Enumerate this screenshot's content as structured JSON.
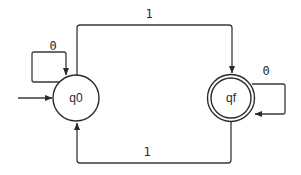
{
  "diagram": {
    "type": "finite-state-automaton",
    "states": [
      {
        "id": "q0",
        "label": "q0",
        "initial": true,
        "accepting": false
      },
      {
        "id": "qf",
        "label": "qf",
        "initial": false,
        "accepting": true
      }
    ],
    "transitions": [
      {
        "from": "q0",
        "to": "q0",
        "label": "0"
      },
      {
        "from": "q0",
        "to": "qf",
        "label": "1"
      },
      {
        "from": "qf",
        "to": "qf",
        "label": "0"
      },
      {
        "from": "qf",
        "to": "q0",
        "label": "1"
      }
    ]
  },
  "labels": {
    "q0": "q0",
    "qf": "qf",
    "q0_self_loop": "0",
    "q0_to_qf": "1",
    "qf_self_loop": "0",
    "qf_to_q0": "1"
  },
  "colors": {
    "stroke": "#2a2a2a",
    "background": "#ffffff"
  }
}
